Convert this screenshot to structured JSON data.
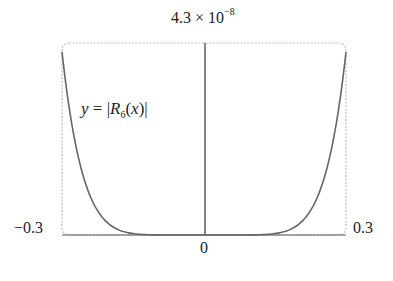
{
  "chart_data": {
    "type": "line",
    "title": "",
    "function_label": "y = |R6(x)|",
    "xlabel": "",
    "ylabel": "",
    "xlim": [
      -0.3,
      0.3
    ],
    "ylim": [
      0,
      4.3e-08
    ],
    "tick_labels": {
      "x_min": "−0.3",
      "x_max": "0.3",
      "x_center": "0",
      "y_max_mantissa": "4.3 × 10",
      "y_max_exponent": "−8"
    },
    "grid": false,
    "legend": "none",
    "series": [
      {
        "name": "|R6(x)|",
        "x": [
          -0.3,
          -0.27,
          -0.24,
          -0.21,
          -0.18,
          -0.15,
          -0.12,
          -0.09,
          -0.06,
          -0.03,
          0,
          0.03,
          0.06,
          0.09,
          0.12,
          0.15,
          0.18,
          0.21,
          0.24,
          0.27,
          0.3
        ],
        "values": [
          4.1e-08,
          2.2e-08,
          1.1e-08,
          4.9e-09,
          1.9e-09,
          6.4e-10,
          1.7e-10,
          3.7e-11,
          4.9e-12,
          1.5e-13,
          0,
          1.5e-13,
          4.9e-12,
          3.7e-11,
          1.7e-10,
          6.4e-10,
          1.9e-09,
          4.9e-09,
          1.1e-08,
          2.2e-08,
          4.1e-08
        ]
      }
    ]
  },
  "labels": {
    "y_max_mantissa": "4.3 × 10",
    "y_max_exponent": "−8",
    "x_min": "−0.3",
    "x_max": "0.3",
    "x_center": "0",
    "func_y": "y",
    "func_eq": " = |",
    "func_R": "R",
    "func_sub": "6",
    "func_arg": "(",
    "func_x": "x",
    "func_close": ")|"
  }
}
